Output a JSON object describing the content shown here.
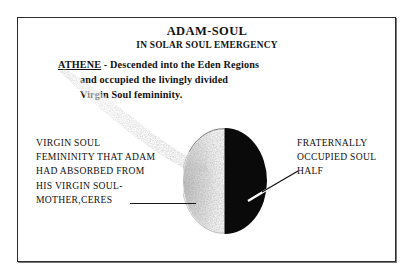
{
  "document": {
    "title": "ADAM-SOUL",
    "subtitle": "IN SOLAR SOUL EMERGENCY"
  },
  "athene_note": {
    "name": "ATHENE",
    "line1": " - Descended into the Eden Regions",
    "line2": "and occupied the livingly divided",
    "line3": "Virgin Soul femininity."
  },
  "labels": {
    "left": {
      "line1": "VIRGIN SOUL",
      "line2": "FEMININITY THAT ADAM",
      "line3": "HAD ABSORBED FROM",
      "line4": "HIS VIRGIN SOUL-",
      "line5": "MOTHER,CERES"
    },
    "right": {
      "line1": "FRATERNALLY",
      "line2": "OCCUPIED SOUL",
      "line3": "HALF"
    }
  },
  "diagram": {
    "type": "split-circle",
    "left_half_name": "virgin-soul-femininity-half",
    "right_half_name": "fraternally-occupied-soul-half",
    "left_half_fill": "#ffffff",
    "right_half_fill": "#0a0a0a",
    "stipple_fill": "#9a9a9a",
    "outline": "#3a3a3a"
  },
  "colors": {
    "ink": "#111111",
    "frame": "#2b2b2b",
    "paper": "#ffffff",
    "shadow": "#7a7a7a"
  }
}
